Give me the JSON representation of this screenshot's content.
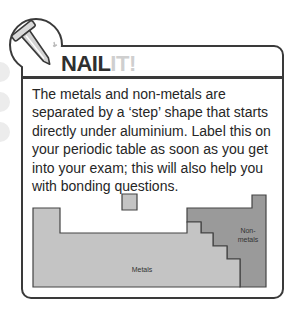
{
  "header": {
    "title_part1": "NAIL",
    "title_part2": "IT!",
    "icon": "nail-icon"
  },
  "body": {
    "text": "The metals and non-metals are separated by a ‘step’ shape that starts directly under aluminium. Label this on your periodic table as soon as you get into your exam; this will also help you with bonding questions."
  },
  "diagram": {
    "metals_label": "Metals",
    "nonmetals_label_line1": "Non-",
    "nonmetals_label_line2": "metals",
    "colors": {
      "metals": "#c4c4c4",
      "nonmetals": "#9a9a9a",
      "outline": "#444444"
    }
  }
}
